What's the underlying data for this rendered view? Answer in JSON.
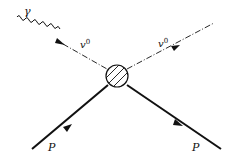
{
  "diagram": {
    "type": "feynman",
    "labels": {
      "photon": "γ",
      "v0_in": "v",
      "v0_in_sup": "0",
      "v0_out": "v",
      "v0_out_sup": "0",
      "p_in": "P",
      "p_out": "P"
    },
    "vertex": {
      "style": "hatched-circle"
    },
    "lines": [
      {
        "id": "photon",
        "style": "wavy",
        "label": "γ"
      },
      {
        "id": "v0-incoming",
        "style": "dash-dot",
        "label": "v0",
        "arrow": true
      },
      {
        "id": "v0-outgoing",
        "style": "dash-dot",
        "label": "v0",
        "arrow": true
      },
      {
        "id": "p-incoming",
        "style": "solid-thick",
        "label": "P",
        "arrow": true
      },
      {
        "id": "p-outgoing",
        "style": "solid-thick",
        "label": "P",
        "arrow": true
      }
    ],
    "colors": {
      "ink": "#111111",
      "background": "#ffffff"
    }
  }
}
